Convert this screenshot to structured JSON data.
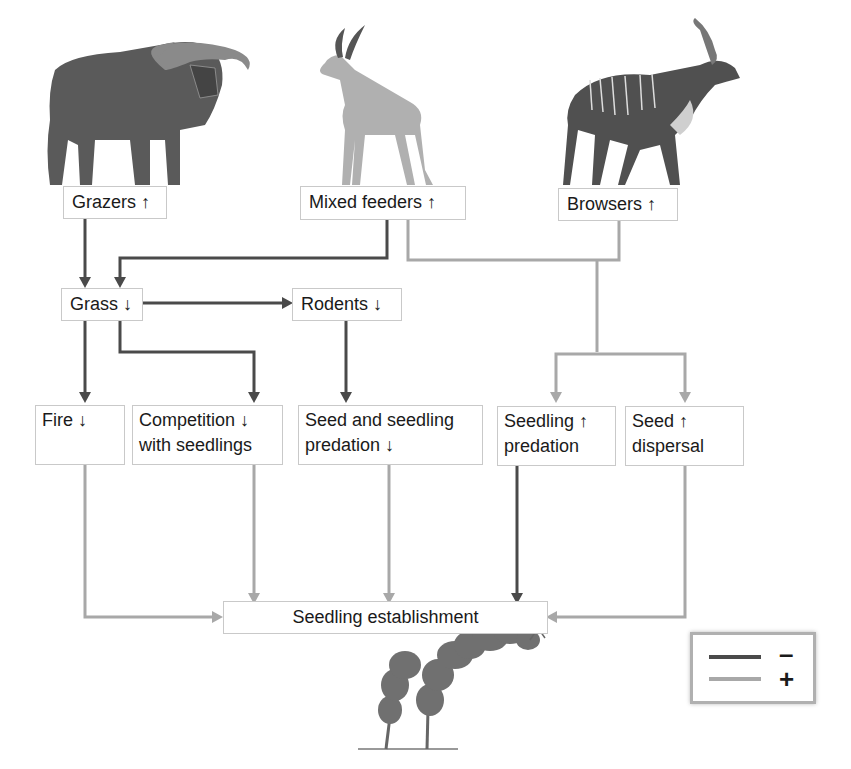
{
  "diagram": {
    "nodes": {
      "grazers": {
        "label": "Grazers ↑",
        "effect": "increase"
      },
      "mixed_feeders": {
        "label": "Mixed feeders ↑",
        "effect": "increase"
      },
      "browsers": {
        "label": "Browsers ↑",
        "effect": "increase"
      },
      "grass": {
        "label": "Grass ↓",
        "effect": "decrease"
      },
      "rodents": {
        "label": "Rodents ↓",
        "effect": "decrease"
      },
      "fire": {
        "line1": "Fire  ↓",
        "effect": "decrease"
      },
      "competition": {
        "line1": "Competition  ↓",
        "line2": "with seedlings",
        "effect": "decrease"
      },
      "seed_predation": {
        "line1": "Seed and seedling",
        "line2": "predation ↓",
        "effect": "decrease"
      },
      "seedling_predation": {
        "line1": "Seedling ↑",
        "line2": "predation",
        "effect": "increase"
      },
      "seed_dispersal": {
        "line1": "Seed   ↑",
        "line2": "dispersal",
        "effect": "increase"
      },
      "establishment": {
        "label": "Seedling establishment"
      }
    },
    "edges": [
      {
        "from": "grazers",
        "to": "grass",
        "sign": "-"
      },
      {
        "from": "mixed_feeders",
        "to": "grass",
        "sign": "-"
      },
      {
        "from": "mixed_feeders",
        "to": "seedling_predation",
        "sign": "+"
      },
      {
        "from": "mixed_feeders",
        "to": "seed_dispersal",
        "sign": "+"
      },
      {
        "from": "browsers",
        "to": "seedling_predation",
        "sign": "+"
      },
      {
        "from": "browsers",
        "to": "seed_dispersal",
        "sign": "+"
      },
      {
        "from": "grass",
        "to": "rodents",
        "sign": "-"
      },
      {
        "from": "grass",
        "to": "fire",
        "sign": "-"
      },
      {
        "from": "grass",
        "to": "competition",
        "sign": "-"
      },
      {
        "from": "rodents",
        "to": "seed_predation",
        "sign": "-"
      },
      {
        "from": "fire",
        "to": "establishment",
        "sign": "+"
      },
      {
        "from": "competition",
        "to": "establishment",
        "sign": "+"
      },
      {
        "from": "seed_predation",
        "to": "establishment",
        "sign": "+"
      },
      {
        "from": "seedling_predation",
        "to": "establishment",
        "sign": "-"
      },
      {
        "from": "seed_dispersal",
        "to": "establishment",
        "sign": "+"
      }
    ],
    "illustrations": [
      "buffalo (grazer)",
      "impala (mixed feeder)",
      "kudu (browser)",
      "acacia seedling"
    ]
  },
  "legend": {
    "negative": {
      "symbol": "–",
      "color": "#4a4a4a"
    },
    "positive": {
      "symbol": "+",
      "color": "#a8a8a8"
    }
  },
  "colors": {
    "negative_line": "#4a4a4a",
    "positive_line": "#a8a8a8",
    "box_border": "#c9c9c9"
  }
}
